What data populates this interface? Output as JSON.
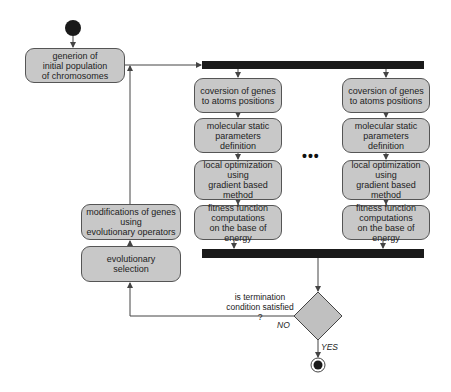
{
  "diagram": {
    "type": "UML activity diagram",
    "nodes": {
      "init": {
        "label": "generion of\ninitial population\nof chromosomes"
      },
      "left_col": [
        {
          "label": "coversion of genes\nto atoms positions"
        },
        {
          "label": "molecular static\nparameters definition"
        },
        {
          "label": "local optimization\nusing\ngradient based method"
        },
        {
          "label": "fitness function\ncomputations\non the base of energy"
        }
      ],
      "right_col": [
        {
          "label": "coversion of genes\nto atoms positions"
        },
        {
          "label": "molecular static\nparameters definition"
        },
        {
          "label": "local optimization\nusing\ngradient based method"
        },
        {
          "label": "fitness function\ncomputations\non the base of energy"
        }
      ],
      "modify": {
        "label": "modifications of genes\nusing\nevolutionary operators"
      },
      "selection": {
        "label": "evolutionary\nselection"
      },
      "decision": {
        "label": "is termination\ncondition satisfied ?"
      }
    },
    "ellipsis": "•••",
    "edges": {
      "no_label": "NO",
      "yes_label": "YES"
    },
    "colors": {
      "box_fill": "#c8c8c8",
      "bar": "#1a1a1a",
      "line": "#444444"
    }
  }
}
